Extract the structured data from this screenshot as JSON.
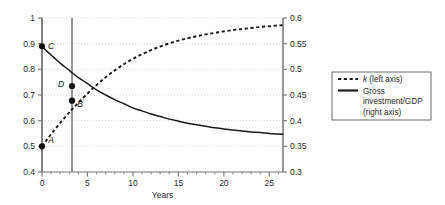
{
  "chart_data": {
    "type": "line",
    "title": "",
    "xlabel": "Years",
    "ylabel_left": "",
    "ylabel_right": "",
    "xlim": [
      0,
      26.5
    ],
    "xticks": [
      0,
      5,
      10,
      15,
      20,
      25
    ],
    "xtick_labels": [
      "0",
      "5",
      "10",
      "15",
      "20",
      "25"
    ],
    "xminor_step": 1,
    "ylim_left": [
      0.4,
      1.0
    ],
    "yticks_left": [
      0.4,
      0.5,
      0.6,
      0.7,
      0.8,
      0.9,
      1.0
    ],
    "ytick_labels_left": [
      "0.4",
      "0.5",
      "0.6",
      "0.7",
      "0.8",
      "0.9",
      "1"
    ],
    "ylim_right": [
      0.3,
      0.6
    ],
    "yticks_right": [
      0.3,
      0.35,
      0.4,
      0.45,
      0.5,
      0.55,
      0.6
    ],
    "ytick_labels_right": [
      "0.3",
      "0.35",
      "0.4",
      "0.45",
      "0.5",
      "0.55",
      "0.6"
    ],
    "grid": "horizontal-dotted",
    "legend_position": "right-outside",
    "series": [
      {
        "name": "k (left axis)",
        "axis": "left",
        "style": "dashed",
        "color": "#1a1a1a",
        "x": [
          0,
          0.5,
          1,
          1.5,
          2,
          2.5,
          3,
          3.3,
          4,
          5,
          6,
          7,
          8,
          9,
          10,
          11,
          12,
          13,
          14,
          15,
          16,
          17,
          18,
          19,
          20,
          21,
          22,
          23,
          24,
          25,
          26,
          26.5
        ],
        "y": [
          0.5,
          0.524,
          0.547,
          0.569,
          0.591,
          0.612,
          0.632,
          0.644,
          0.67,
          0.706,
          0.739,
          0.769,
          0.796,
          0.82,
          0.841,
          0.859,
          0.875,
          0.889,
          0.901,
          0.912,
          0.921,
          0.929,
          0.936,
          0.942,
          0.948,
          0.953,
          0.957,
          0.961,
          0.965,
          0.968,
          0.971,
          0.972
        ]
      },
      {
        "name": "Gross investment/GDP (right axis)",
        "axis": "right",
        "style": "solid",
        "color": "#1a1a1a",
        "x": [
          0,
          0.5,
          1,
          1.5,
          2,
          2.5,
          3,
          3.3,
          4,
          5,
          6,
          7,
          8,
          9,
          10,
          11,
          12,
          13,
          14,
          15,
          16,
          17,
          18,
          19,
          20,
          21,
          22,
          23,
          24,
          25,
          26,
          26.5
        ],
        "y": [
          0.545,
          0.536,
          0.528,
          0.52,
          0.512,
          0.505,
          0.498,
          0.4935,
          0.484,
          0.472,
          0.46,
          0.45,
          0.441,
          0.433,
          0.425,
          0.419,
          0.413,
          0.408,
          0.403,
          0.399,
          0.395,
          0.392,
          0.389,
          0.386,
          0.384,
          0.382,
          0.38,
          0.378,
          0.377,
          0.375,
          0.374,
          0.3735
        ]
      }
    ],
    "reference_lines": [
      {
        "type": "vertical",
        "x": 0
      },
      {
        "type": "vertical",
        "x": 3.3
      }
    ],
    "annotations": [
      {
        "label": "A",
        "x": 0,
        "y_left": 0.5,
        "series": "k (left axis)",
        "label_dx": 9,
        "label_dy": -3
      },
      {
        "label": "C",
        "x": 0,
        "y_left": 0.89,
        "series": "Gross investment/GDP (right axis)",
        "label_dx": 9,
        "label_dy": 3
      },
      {
        "label": "D",
        "x": 3.3,
        "y_left": 0.735,
        "series": "Gross investment/GDP (right axis)",
        "label_dx": -11,
        "label_dy": 1
      },
      {
        "label": "B",
        "x": 3.3,
        "y_left": 0.678,
        "series": "k (left axis)",
        "label_dx": 8,
        "label_dy": 6
      }
    ]
  },
  "legend": {
    "entries": [
      {
        "label_italic": "k",
        "label_rest": " (left axis)",
        "style": "dashed"
      },
      {
        "label_italic": "",
        "label_rest": "Gross",
        "style": "solid"
      },
      {
        "label_italic": "",
        "label_rest": "investment/GDP",
        "style": "none"
      },
      {
        "label_italic": "",
        "label_rest": "(right axis)",
        "style": "none"
      }
    ]
  },
  "colors": {
    "axis": "#7d7d7d",
    "grid": "#cfcfcf",
    "line": "#1a1a1a",
    "legend_border": "#5a5a5a",
    "background": "#ffffff"
  }
}
